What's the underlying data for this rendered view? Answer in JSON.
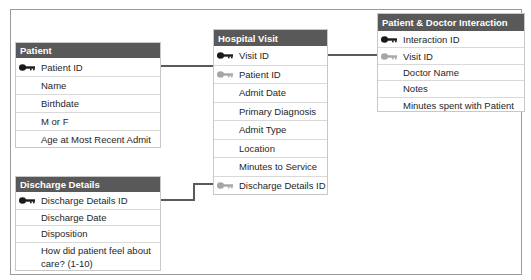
{
  "diagram": {
    "type": "entity-relationship",
    "colors": {
      "header_bg": "#595959",
      "header_text": "#ffffff",
      "primary_key": "#1a1a1a",
      "foreign_key": "#a6a6a6",
      "connector": "#5a5a5a"
    },
    "tables": {
      "patient": {
        "title": "Patient",
        "fields": [
          {
            "name": "Patient ID",
            "key": "primary"
          },
          {
            "name": "Name",
            "key": "none"
          },
          {
            "name": "Birthdate",
            "key": "none"
          },
          {
            "name": "M or F",
            "key": "none"
          },
          {
            "name": "Age at Most Recent Admit",
            "key": "none"
          }
        ]
      },
      "hospital_visit": {
        "title": "Hospital Visit",
        "fields": [
          {
            "name": "Visit ID",
            "key": "primary"
          },
          {
            "name": "Patient ID",
            "key": "foreign"
          },
          {
            "name": "Admit Date",
            "key": "none"
          },
          {
            "name": "Primary Diagnosis",
            "key": "none"
          },
          {
            "name": "Admit Type",
            "key": "none"
          },
          {
            "name": "Location",
            "key": "none"
          },
          {
            "name": "Minutes to Service",
            "key": "none"
          },
          {
            "name": "Discharge Details ID",
            "key": "foreign"
          }
        ]
      },
      "patient_doctor_interaction": {
        "title": "Patient & Doctor Interaction",
        "fields": [
          {
            "name": "Interaction ID",
            "key": "primary"
          },
          {
            "name": "Visit ID",
            "key": "foreign"
          },
          {
            "name": "Doctor Name",
            "key": "none"
          },
          {
            "name": "Notes",
            "key": "none"
          },
          {
            "name": "Minutes spent with Patient",
            "key": "none"
          }
        ]
      },
      "discharge_details": {
        "title": "Discharge Details",
        "fields": [
          {
            "name": "Discharge Details ID",
            "key": "primary"
          },
          {
            "name": "Discharge Date",
            "key": "none"
          },
          {
            "name": "Disposition",
            "key": "none"
          },
          {
            "name": "How did patient feel about care? (1-10)",
            "key": "none"
          }
        ]
      }
    },
    "relationships": [
      {
        "from": "Patient.Patient ID",
        "to": "Hospital Visit.Patient ID"
      },
      {
        "from": "Hospital Visit.Visit ID",
        "to": "Patient & Doctor Interaction.Visit ID"
      },
      {
        "from": "Discharge Details.Discharge Details ID",
        "to": "Hospital Visit.Discharge Details ID"
      }
    ]
  }
}
